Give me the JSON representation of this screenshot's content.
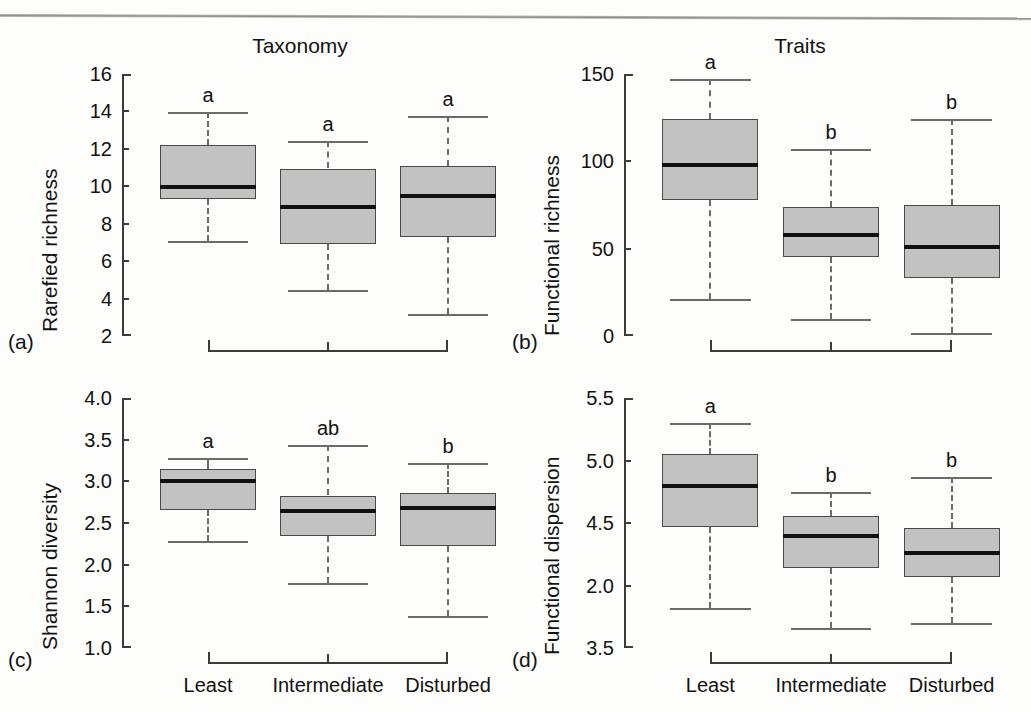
{
  "page": {
    "page_number_mark": "",
    "header_rule": "horizontal-rule"
  },
  "figure": {
    "categories": [
      "Least",
      "Intermediate",
      "Disturbed"
    ],
    "panels": [
      {
        "letter": "(a)",
        "title": "Taxonomy",
        "ylabel": "Rarefied richness",
        "yticks": [
          "16",
          "14",
          "12",
          "10",
          "8",
          "6",
          "4",
          "2"
        ],
        "ytick_values": [
          16,
          14,
          12,
          10,
          8,
          6,
          4,
          2
        ],
        "ylim": [
          2,
          16
        ],
        "sig_letters": [
          "a",
          "a",
          "a"
        ]
      },
      {
        "letter": "(b)",
        "title": "Traits",
        "ylabel": "Functional richness",
        "yticks": [
          "150",
          "100",
          "50",
          "0"
        ],
        "ytick_values": [
          150,
          100,
          50,
          0
        ],
        "ylim": [
          0,
          150
        ],
        "sig_letters": [
          "a",
          "b",
          "b"
        ]
      },
      {
        "letter": "(c)",
        "title": "",
        "ylabel": "Shannon diversity",
        "yticks": [
          "4.0",
          "3.5",
          "3.0",
          "2.5",
          "2.0",
          "1.5",
          "1.0"
        ],
        "ytick_values": [
          4.0,
          3.5,
          3.0,
          2.5,
          2.0,
          1.5,
          1.0
        ],
        "ylim": [
          1.0,
          4.0
        ],
        "sig_letters": [
          "a",
          "ab",
          "b"
        ]
      },
      {
        "letter": "(d)",
        "title": "",
        "ylabel": "Functional dispersion",
        "yticks": [
          "5.5",
          "5.0",
          "4.5",
          "2.0",
          "3.5"
        ],
        "ytick_values": [
          5.5,
          5.0,
          4.5,
          4.0,
          3.5
        ],
        "ylim": [
          3.5,
          5.5
        ],
        "sig_letters": [
          "a",
          "b",
          "b"
        ]
      }
    ]
  },
  "chart_data": [
    {
      "type": "box",
      "panel": "a",
      "title": "Taxonomy",
      "xlabel": "",
      "ylabel": "Rarefied richness",
      "ylim": [
        2,
        16
      ],
      "yticks": [
        2,
        4,
        6,
        8,
        10,
        12,
        14,
        16
      ],
      "categories": [
        "Least",
        "Intermediate",
        "Disturbed"
      ],
      "grid": false,
      "boxes": [
        {
          "category": "Least",
          "whisker_low": 7.1,
          "q1": 9.3,
          "median": 9.95,
          "q3": 12.2,
          "whisker_high": 13.95,
          "letter": "a"
        },
        {
          "category": "Intermediate",
          "whisker_low": 4.45,
          "q1": 6.9,
          "median": 8.9,
          "q3": 10.95,
          "whisker_high": 12.4,
          "letter": "a"
        },
        {
          "category": "Disturbed",
          "whisker_low": 3.15,
          "q1": 7.3,
          "median": 9.5,
          "q3": 11.1,
          "whisker_high": 13.75,
          "letter": "a"
        }
      ]
    },
    {
      "type": "box",
      "panel": "b",
      "title": "Traits",
      "xlabel": "",
      "ylabel": "Functional richness",
      "ylim": [
        0,
        150
      ],
      "yticks": [
        0,
        50,
        100,
        150
      ],
      "categories": [
        "Least",
        "Intermediate",
        "Disturbed"
      ],
      "grid": false,
      "boxes": [
        {
          "category": "Least",
          "whisker_low": 21,
          "q1": 78,
          "median": 98,
          "q3": 124,
          "whisker_high": 147,
          "letter": "a"
        },
        {
          "category": "Intermediate",
          "whisker_low": 9.5,
          "q1": 45,
          "median": 58,
          "q3": 74,
          "whisker_high": 107,
          "letter": "b"
        },
        {
          "category": "Disturbed",
          "whisker_low": 2,
          "q1": 33,
          "median": 51,
          "q3": 75,
          "whisker_high": 124,
          "letter": "b"
        }
      ]
    },
    {
      "type": "box",
      "panel": "c",
      "title": "",
      "xlabel": "",
      "ylabel": "Shannon diversity",
      "ylim": [
        1.0,
        4.0
      ],
      "yticks": [
        1.0,
        1.5,
        2.0,
        2.5,
        3.0,
        3.5,
        4.0
      ],
      "categories": [
        "Least",
        "Intermediate",
        "Disturbed"
      ],
      "grid": false,
      "boxes": [
        {
          "category": "Least",
          "whisker_low": 2.28,
          "q1": 2.66,
          "median": 3.01,
          "q3": 3.15,
          "whisker_high": 3.28,
          "letter": "a"
        },
        {
          "category": "Intermediate",
          "whisker_low": 1.78,
          "q1": 2.35,
          "median": 2.65,
          "q3": 2.83,
          "whisker_high": 3.44,
          "letter": "ab"
        },
        {
          "category": "Disturbed",
          "whisker_low": 1.38,
          "q1": 2.23,
          "median": 2.68,
          "q3": 2.86,
          "whisker_high": 3.22,
          "letter": "b"
        }
      ]
    },
    {
      "type": "box",
      "panel": "d",
      "title": "",
      "xlabel": "",
      "ylabel": "Functional dispersion",
      "ylim": [
        3.5,
        5.5
      ],
      "yticks": [
        3.5,
        4.0,
        4.5,
        5.0,
        5.5
      ],
      "ytick_labels_as_printed": [
        "5.5",
        "5.0",
        "4.5",
        "2.0",
        "3.5"
      ],
      "categories": [
        "Least",
        "Intermediate",
        "Disturbed"
      ],
      "grid": false,
      "boxes": [
        {
          "category": "Least",
          "whisker_low": 3.82,
          "q1": 4.47,
          "median": 4.8,
          "q3": 5.05,
          "whisker_high": 5.3,
          "letter": "a"
        },
        {
          "category": "Intermediate",
          "whisker_low": 3.66,
          "q1": 4.14,
          "median": 4.4,
          "q3": 4.56,
          "whisker_high": 4.75,
          "letter": "b"
        },
        {
          "category": "Disturbed",
          "whisker_low": 3.7,
          "q1": 4.07,
          "median": 4.26,
          "q3": 4.46,
          "whisker_high": 4.87,
          "letter": "b"
        }
      ]
    }
  ]
}
